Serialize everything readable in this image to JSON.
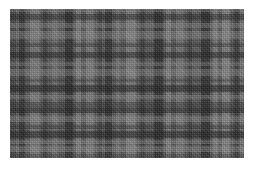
{
  "image": {
    "description": "Grayscale plaid tartan fabric texture",
    "alt": "Gray plaid fabric",
    "background_color": "#ffffff",
    "base_color": "#5a5a5a",
    "bounds": {
      "x": 10,
      "y": 9,
      "width": 234,
      "height": 149
    }
  },
  "vertical_stripes": [
    {
      "x": 0,
      "w": 6,
      "color": "#3c3c3c",
      "alpha": 0.55
    },
    {
      "x": 9,
      "w": 6,
      "color": "#1e1e1e",
      "alpha": 0.55
    },
    {
      "x": 20,
      "w": 10,
      "color": "#9a9a9a",
      "alpha": 0.45
    },
    {
      "x": 33,
      "w": 4,
      "color": "#2a2a2a",
      "alpha": 0.45
    },
    {
      "x": 42,
      "w": 6,
      "color": "#888888",
      "alpha": 0.4
    },
    {
      "x": 55,
      "w": 8,
      "color": "#1a1a1a",
      "alpha": 0.6
    },
    {
      "x": 66,
      "w": 5,
      "color": "#a0a0a0",
      "alpha": 0.45
    },
    {
      "x": 76,
      "w": 8,
      "color": "#9c9c9c",
      "alpha": 0.45
    },
    {
      "x": 88,
      "w": 4,
      "color": "#2c2c2c",
      "alpha": 0.5
    },
    {
      "x": 95,
      "w": 7,
      "color": "#1c1c1c",
      "alpha": 0.55
    },
    {
      "x": 106,
      "w": 4,
      "color": "#8c8c8c",
      "alpha": 0.4
    },
    {
      "x": 116,
      "w": 10,
      "color": "#a4a4a4",
      "alpha": 0.45
    },
    {
      "x": 130,
      "w": 5,
      "color": "#2a2a2a",
      "alpha": 0.5
    },
    {
      "x": 144,
      "w": 9,
      "color": "#1a1a1a",
      "alpha": 0.6
    },
    {
      "x": 156,
      "w": 5,
      "color": "#a0a0a0",
      "alpha": 0.45
    },
    {
      "x": 166,
      "w": 8,
      "color": "#959595",
      "alpha": 0.4
    },
    {
      "x": 178,
      "w": 4,
      "color": "#2a2a2a",
      "alpha": 0.45
    },
    {
      "x": 191,
      "w": 9,
      "color": "#1c1c1c",
      "alpha": 0.6
    },
    {
      "x": 203,
      "w": 5,
      "color": "#9e9e9e",
      "alpha": 0.45
    },
    {
      "x": 212,
      "w": 8,
      "color": "#a8a8a8",
      "alpha": 0.45
    },
    {
      "x": 224,
      "w": 5,
      "color": "#262626",
      "alpha": 0.5
    },
    {
      "x": 230,
      "w": 4,
      "color": "#8a8a8a",
      "alpha": 0.4
    }
  ],
  "horizontal_stripes": [
    {
      "y": 0,
      "h": 3,
      "color": "#8c8c8c",
      "alpha": 0.35
    },
    {
      "y": 5,
      "h": 6,
      "color": "#1e1e1e",
      "alpha": 0.45
    },
    {
      "y": 14,
      "h": 5,
      "color": "#9a9a9a",
      "alpha": 0.35
    },
    {
      "y": 22,
      "h": 8,
      "color": "#a2a2a2",
      "alpha": 0.35
    },
    {
      "y": 34,
      "h": 4,
      "color": "#2a2a2a",
      "alpha": 0.4
    },
    {
      "y": 43,
      "h": 6,
      "color": "#1a1a1a",
      "alpha": 0.5
    },
    {
      "y": 53,
      "h": 4,
      "color": "#969696",
      "alpha": 0.35
    },
    {
      "y": 60,
      "h": 7,
      "color": "#a0a0a0",
      "alpha": 0.35
    },
    {
      "y": 70,
      "h": 3,
      "color": "#2c2c2c",
      "alpha": 0.35
    },
    {
      "y": 76,
      "h": 7,
      "color": "#1c1c1c",
      "alpha": 0.55
    },
    {
      "y": 86,
      "h": 4,
      "color": "#999999",
      "alpha": 0.35
    },
    {
      "y": 93,
      "h": 6,
      "color": "#2a2a2a",
      "alpha": 0.4
    },
    {
      "y": 99,
      "h": 5,
      "color": "#1a1a1a",
      "alpha": 0.5
    },
    {
      "y": 107,
      "h": 6,
      "color": "#a2a2a2",
      "alpha": 0.35
    },
    {
      "y": 116,
      "h": 4,
      "color": "#2a2a2a",
      "alpha": 0.4
    },
    {
      "y": 122,
      "h": 7,
      "color": "#1c1c1c",
      "alpha": 0.55
    },
    {
      "y": 131,
      "h": 4,
      "color": "#9a9a9a",
      "alpha": 0.35
    },
    {
      "y": 137,
      "h": 6,
      "color": "#a4a4a4",
      "alpha": 0.35
    },
    {
      "y": 145,
      "h": 4,
      "color": "#3a3a3a",
      "alpha": 0.35
    }
  ]
}
